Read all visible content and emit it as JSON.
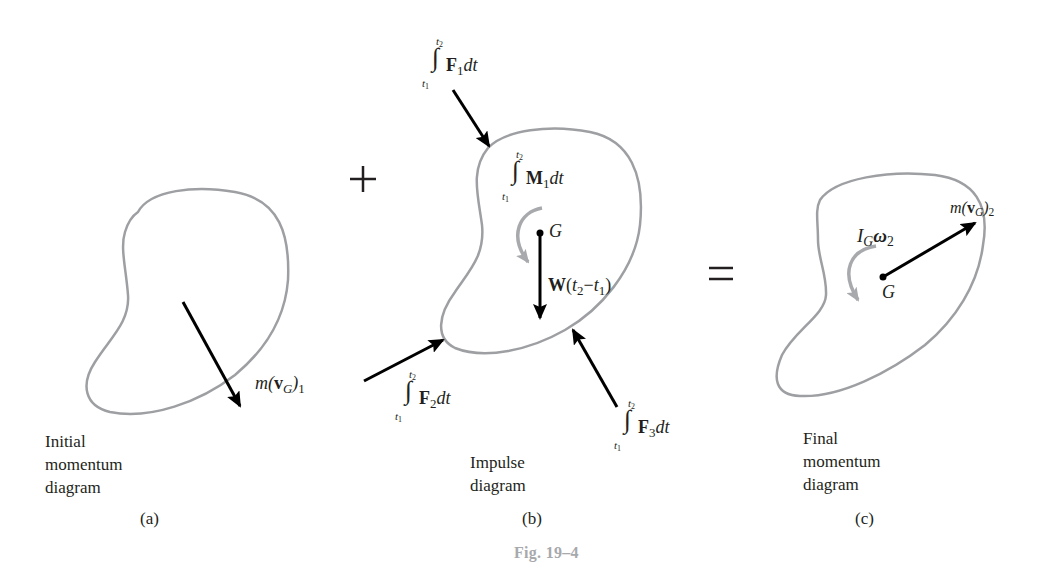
{
  "figure": {
    "title": "Fig. 19–4",
    "title_color": "#a7a9ac",
    "outline_color": "#9d9fa2",
    "arrow_color": "#000000",
    "moment_arrow_color": "#a7a9ac"
  },
  "operators": {
    "plus": "+",
    "equals": "="
  },
  "panels": [
    {
      "id": "a",
      "sublabel": "(a)",
      "caption_lines": [
        "Initial",
        "momentum",
        "diagram"
      ],
      "vectors": [
        {
          "name": "linear-momentum-1",
          "label_prefix": "m(",
          "label_bold": "v",
          "label_sub": "G",
          "label_suffix": ")",
          "label_post_sub": "1"
        }
      ]
    },
    {
      "id": "b",
      "sublabel": "(b)",
      "caption_lines": [
        "Impulse",
        "diagram"
      ],
      "integrals": [
        {
          "name": "impulse-f1",
          "upper": "t",
          "upper_sub": "2",
          "lower": "t",
          "lower_sub": "1",
          "bold": "F",
          "bold_sub": "1",
          "tail": "dt"
        },
        {
          "name": "angular-impulse-m1",
          "upper": "t",
          "upper_sub": "2",
          "lower": "t",
          "lower_sub": "1",
          "bold": "M",
          "bold_sub": "1",
          "tail": "dt"
        },
        {
          "name": "impulse-f2",
          "upper": "t",
          "upper_sub": "2",
          "lower": "t",
          "lower_sub": "1",
          "bold": "F",
          "bold_sub": "2",
          "tail": "dt"
        },
        {
          "name": "impulse-f3",
          "upper": "t",
          "upper_sub": "2",
          "lower": "t",
          "lower_sub": "1",
          "bold": "F",
          "bold_sub": "3",
          "tail": "dt"
        }
      ],
      "center_label": "G",
      "weight": {
        "bold": "W",
        "open": "(",
        "t2": "t",
        "t2_sub": "2",
        "minus": "−",
        "t1": "t",
        "t1_sub": "1",
        "close": ")"
      }
    },
    {
      "id": "c",
      "sublabel": "(c)",
      "caption_lines": [
        "Final",
        "momentum",
        "diagram"
      ],
      "center_label": "G",
      "angular": {
        "I": "I",
        "I_sub": "G",
        "omega": "ω",
        "omega_sub": "2"
      },
      "vectors": [
        {
          "name": "linear-momentum-2",
          "label_prefix": "m(",
          "label_bold": "v",
          "label_sub": "G",
          "label_suffix": ")",
          "label_post_sub": "2"
        }
      ]
    }
  ]
}
